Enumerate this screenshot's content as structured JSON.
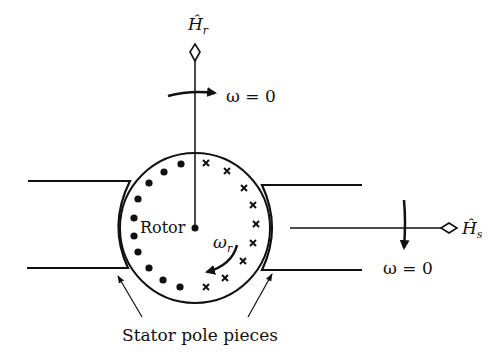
{
  "diagram": {
    "labels": {
      "rotor_field": "Ĥ",
      "rotor_field_sub": "r",
      "stator_field": "Ĥ",
      "stator_field_sub": "s",
      "rotor": "Rotor",
      "rotor_speed": "ω",
      "rotor_speed_sub": "r",
      "omega_top": "ω = 0",
      "omega_right": "ω = 0",
      "stator_pole_pieces": "Stator pole pieces"
    },
    "conductors": {
      "left_side_symbol": "dot",
      "right_side_symbol": "cross",
      "count_each_side": 10
    },
    "colors": {
      "ink": "#111111",
      "background": "#ffffff"
    }
  }
}
